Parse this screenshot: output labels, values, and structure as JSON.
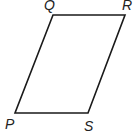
{
  "figure": {
    "shape": "parallelogram",
    "vertices": [
      {
        "label": "Q",
        "x": 53,
        "y": 15,
        "lx": 44,
        "ly": 10
      },
      {
        "label": "R",
        "x": 125,
        "y": 15,
        "lx": 122,
        "ly": 10
      },
      {
        "label": "S",
        "x": 88,
        "y": 113,
        "lx": 84,
        "ly": 131
      },
      {
        "label": "P",
        "x": 15,
        "y": 113,
        "lx": 5,
        "ly": 129
      }
    ],
    "stroke_color": "#1a1a1a"
  }
}
